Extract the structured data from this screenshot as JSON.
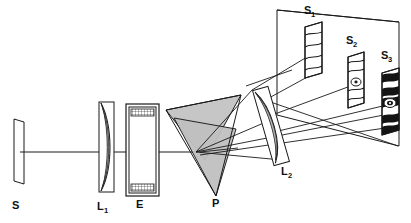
{
  "figure": {
    "background_color": "#ffffff",
    "line_color": "#1a1a1a",
    "fill_gray": "#bdbdbd",
    "fill_light": "#d8d8d8",
    "fill_dark": "#141414",
    "width": 411,
    "height": 223
  },
  "components": [
    {
      "id": "S",
      "label": "S",
      "sub": "",
      "name": "source-slit",
      "label_x": 12,
      "label_y": 209
    },
    {
      "id": "L1",
      "label": "L",
      "sub": "1",
      "name": "lens-l1",
      "label_x": 97,
      "label_y": 210
    },
    {
      "id": "E",
      "label": "E",
      "sub": "",
      "name": "etalon-cell",
      "label_x": 136,
      "label_y": 208
    },
    {
      "id": "P",
      "label": "P",
      "sub": "",
      "name": "prism",
      "label_x": 212,
      "label_y": 207
    },
    {
      "id": "L2",
      "label": "L",
      "sub": "2",
      "name": "lens-l2",
      "label_x": 281,
      "label_y": 175
    },
    {
      "id": "S1",
      "label": "S",
      "sub": "1",
      "name": "screen-s1",
      "label_x": 304,
      "label_y": 14
    },
    {
      "id": "S2",
      "label": "S",
      "sub": "2",
      "name": "screen-s2",
      "label_x": 346,
      "label_y": 44
    },
    {
      "id": "S3",
      "label": "S",
      "sub": "3",
      "name": "screen-s3",
      "label_x": 381,
      "label_y": 59
    }
  ],
  "fringe_patterns": {
    "s1": {
      "bands": 4,
      "style": "curved-bands-light",
      "center_spot": false
    },
    "s2": {
      "bands": 5,
      "style": "curved-bands-light",
      "center_spot": true
    },
    "s3": {
      "bands": 6,
      "style": "high-contrast-dark",
      "center_spot": true
    }
  },
  "optic_axis": {
    "from_x": 20,
    "from_y": 152,
    "to_x": 200,
    "to_y": 152
  }
}
